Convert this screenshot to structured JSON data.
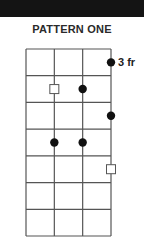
{
  "header": {
    "title": "PATTERN ONE"
  },
  "fretboard": {
    "strings": 4,
    "frets": 7,
    "position_label": "3 fr",
    "grid": {
      "left": 26,
      "right": 111,
      "top": 49,
      "bottom": 236
    },
    "colors": {
      "line": "#555555",
      "dot": "#111111",
      "square_fill": "#ffffff",
      "square_stroke": "#555555"
    },
    "markers": [
      {
        "type": "dot",
        "string": 4,
        "fret": 1
      },
      {
        "type": "square",
        "string": 2,
        "fret": 2
      },
      {
        "type": "dot",
        "string": 3,
        "fret": 2
      },
      {
        "type": "dot",
        "string": 4,
        "fret": 3
      },
      {
        "type": "dot",
        "string": 2,
        "fret": 4
      },
      {
        "type": "dot",
        "string": 3,
        "fret": 4
      },
      {
        "type": "square",
        "string": 4,
        "fret": 5
      }
    ]
  }
}
